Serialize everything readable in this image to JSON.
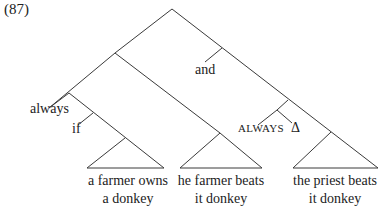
{
  "example_number": "(87)",
  "labels": {
    "and": "and",
    "always": "always",
    "if": "if",
    "always_caps": "ALWAYS",
    "delta": "Δ"
  },
  "leaves": [
    {
      "line1": "a farmer owns",
      "line2": "a donkey"
    },
    {
      "line1": "he farmer beats",
      "line2": "it donkey"
    },
    {
      "line1": "the priest beats",
      "line2": "it donkey"
    }
  ],
  "colors": {
    "line": "#3a3a3a",
    "text": "#222222",
    "background": "#ffffff"
  }
}
